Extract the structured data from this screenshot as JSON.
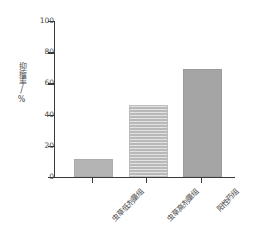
{
  "chart_data": {
    "type": "bar",
    "title": "",
    "subtitle": "",
    "xlabel": "",
    "ylabel": "抑瘤率/%",
    "categories": [
      "虫草低剂量组",
      "虫草高剂量组",
      "阳性药组"
    ],
    "values": [
      10,
      45,
      68
    ],
    "series": [
      {
        "name": "抑瘤率",
        "values": [
          10,
          45,
          68
        ]
      }
    ],
    "ylim": [
      0,
      100
    ],
    "yticks": [
      0,
      20,
      40,
      60,
      80,
      100
    ],
    "ytick_labels": [
      "0",
      "20",
      "40",
      "60",
      "80",
      "100"
    ],
    "grid": false,
    "legend": false,
    "legend_position": "none",
    "annotations": [],
    "bar_styles": [
      {
        "category": "虫草低剂量组",
        "fill": "#b4b4b4",
        "pattern": "solid"
      },
      {
        "category": "虫草高剂量组",
        "fill": "#c6c6c6",
        "pattern": "horizontal-stripes"
      },
      {
        "category": "阳性药组",
        "fill": "#a5a5a5",
        "pattern": "solid"
      }
    ],
    "axis_color": "#3a3a3a",
    "text_color": "#4a4a4a",
    "background": "#ffffff"
  }
}
